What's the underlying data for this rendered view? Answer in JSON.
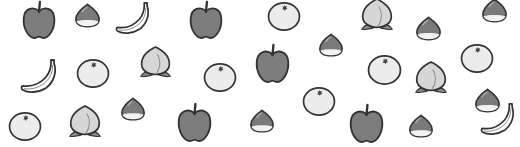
{
  "scene": {
    "title": "Scattered fruit illustration",
    "background": "#ffffff",
    "colors": {
      "outline": "#333333",
      "apple_fill": "#7d7d7d",
      "chestnut_fill": "#7a7a7a",
      "chestnut_base": "#f2f2f2",
      "orange_fill": "#ececec",
      "peach_fill": "#d6d6d6",
      "peach_leaf": "#8a8a8a",
      "banana_fill": "#ffffff"
    },
    "fruits": [
      {
        "type": "apple",
        "x": 39,
        "y": 20,
        "size": 36
      },
      {
        "type": "chestnut",
        "x": 87,
        "y": 15,
        "size": 27
      },
      {
        "type": "banana",
        "x": 132,
        "y": 18,
        "size": 38
      },
      {
        "type": "apple",
        "x": 206,
        "y": 20,
        "size": 36
      },
      {
        "type": "orange",
        "x": 284,
        "y": 16,
        "size": 34
      },
      {
        "type": "peach",
        "x": 377,
        "y": 15,
        "size": 38
      },
      {
        "type": "chestnut",
        "x": 428,
        "y": 28,
        "size": 27
      },
      {
        "type": "chestnut",
        "x": 494,
        "y": 10,
        "size": 27
      },
      {
        "type": "banana",
        "x": 38,
        "y": 76,
        "size": 40
      },
      {
        "type": "orange",
        "x": 93,
        "y": 73,
        "size": 34
      },
      {
        "type": "peach",
        "x": 155,
        "y": 62,
        "size": 37
      },
      {
        "type": "orange",
        "x": 220,
        "y": 77,
        "size": 34
      },
      {
        "type": "apple",
        "x": 272,
        "y": 63,
        "size": 37
      },
      {
        "type": "chestnut",
        "x": 331,
        "y": 45,
        "size": 26
      },
      {
        "type": "orange",
        "x": 384,
        "y": 69,
        "size": 35
      },
      {
        "type": "peach",
        "x": 431,
        "y": 78,
        "size": 38
      },
      {
        "type": "orange",
        "x": 477,
        "y": 58,
        "size": 34
      },
      {
        "type": "chestnut",
        "x": 487,
        "y": 100,
        "size": 27
      },
      {
        "type": "orange",
        "x": 25,
        "y": 126,
        "size": 34
      },
      {
        "type": "peach",
        "x": 85,
        "y": 122,
        "size": 38
      },
      {
        "type": "chestnut",
        "x": 133,
        "y": 109,
        "size": 26
      },
      {
        "type": "apple",
        "x": 194,
        "y": 122,
        "size": 37
      },
      {
        "type": "chestnut",
        "x": 262,
        "y": 121,
        "size": 26
      },
      {
        "type": "orange",
        "x": 319,
        "y": 101,
        "size": 34
      },
      {
        "type": "apple",
        "x": 366,
        "y": 123,
        "size": 37
      },
      {
        "type": "chestnut",
        "x": 421,
        "y": 126,
        "size": 26
      },
      {
        "type": "banana",
        "x": 497,
        "y": 119,
        "size": 38
      }
    ]
  }
}
